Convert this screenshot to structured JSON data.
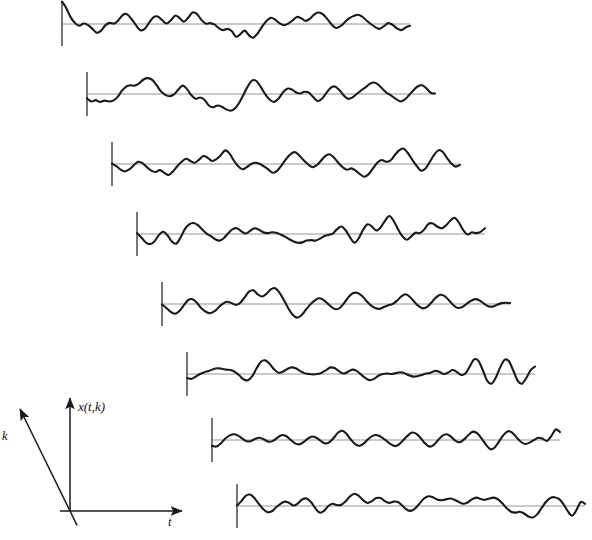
{
  "figure": {
    "kind": "ensemble-of-random-process-realizations",
    "background_color": "#ffffff",
    "width": 592,
    "height": 540,
    "trace_color": "#1a1a1a",
    "baseline_color": "#8a8a8a",
    "tick_color": "#4a4a4a",
    "axis_color": "#1a1a1a",
    "trace_stroke_width": 2.1,
    "baseline_stroke_width": 0.9,
    "tick_stroke_width": 1.5
  },
  "axes": {
    "vertical_label": "x(t,k)",
    "horizontal_label": "t",
    "depth_label": "k",
    "origin": {
      "x": 70,
      "y": 511
    },
    "vertical_tip": {
      "x": 70,
      "y": 398
    },
    "horizontal_tip": {
      "x": 182,
      "y": 511
    },
    "depth_tip": {
      "x": 20,
      "y": 409
    },
    "vertical_label_pos": {
      "x": 78,
      "y": 411
    },
    "horizontal_label_pos": {
      "x": 168,
      "y": 526
    },
    "depth_label_pos": {
      "x": 2,
      "y": 440
    }
  },
  "chart_data": {
    "type": "line",
    "title": "",
    "xlabel": "t",
    "ylabel": "x(t,k)",
    "zlabel": "k",
    "grid": false,
    "legend": "none",
    "series_count": 8,
    "samples_per_series": 81,
    "x_range": [
      0,
      80
    ],
    "y_range": [
      -1,
      1
    ],
    "geometry": {
      "first_baseline_x": 62,
      "first_baseline_y": 24,
      "stagger_dx": 25,
      "stagger_dy": 70,
      "trace_length": 348,
      "amplitude_px": 22,
      "tick_up": 22,
      "tick_down": 22
    },
    "series": [
      {
        "name": "k = 1",
        "baseline_origin": {
          "x": 62,
          "y": 24
        },
        "length": 348,
        "values": [
          1.02,
          0.72,
          0.3,
          0.05,
          -0.08,
          0.02,
          -0.05,
          -0.22,
          -0.4,
          -0.3,
          -0.05,
          0.05,
          0.02,
          0.18,
          0.42,
          0.44,
          0.22,
          -0.05,
          -0.28,
          -0.22,
          0.05,
          0.3,
          0.34,
          0.18,
          0.02,
          0.16,
          0.38,
          0.28,
          0.1,
          0.28,
          0.52,
          0.46,
          0.2,
          0.02,
          0.04,
          -0.02,
          -0.18,
          -0.28,
          -0.22,
          -0.32,
          -0.58,
          -0.46,
          -0.3,
          -0.52,
          -0.62,
          -0.42,
          -0.12,
          0.14,
          0.28,
          0.2,
          0.04,
          -0.06,
          0.02,
          0.16,
          0.32,
          0.26,
          0.14,
          0.24,
          0.44,
          0.52,
          0.44,
          0.22,
          -0.02,
          -0.18,
          -0.1,
          0.08,
          0.26,
          0.36,
          0.42,
          0.34,
          0.16,
          0.0,
          -0.14,
          -0.22,
          -0.1,
          0.04,
          -0.04,
          -0.2,
          -0.28,
          -0.16,
          -0.08
        ]
      },
      {
        "name": "k = 2",
        "baseline_origin": {
          "x": 87,
          "y": 94
        },
        "length": 348,
        "values": [
          -0.2,
          -0.34,
          -0.28,
          -0.36,
          -0.3,
          -0.34,
          -0.3,
          -0.14,
          0.14,
          0.34,
          0.4,
          0.38,
          0.48,
          0.66,
          0.72,
          0.64,
          0.4,
          0.12,
          -0.04,
          -0.1,
          -0.02,
          0.2,
          0.38,
          0.22,
          -0.06,
          -0.22,
          -0.16,
          -0.26,
          -0.52,
          -0.6,
          -0.52,
          -0.58,
          -0.7,
          -0.76,
          -0.66,
          -0.4,
          -0.02,
          0.36,
          0.62,
          0.58,
          0.3,
          -0.02,
          -0.26,
          -0.36,
          -0.22,
          0.06,
          0.24,
          0.22,
          0.08,
          0.02,
          0.1,
          0.06,
          -0.14,
          -0.32,
          -0.22,
          0.04,
          0.28,
          0.34,
          0.18,
          -0.06,
          -0.22,
          -0.16,
          0.0,
          0.16,
          0.3,
          0.46,
          0.52,
          0.42,
          0.22,
          0.04,
          -0.08,
          -0.22,
          -0.34,
          -0.26,
          -0.06,
          0.16,
          0.34,
          0.4,
          0.26,
          0.06,
          0.02
        ]
      },
      {
        "name": "k = 3",
        "baseline_origin": {
          "x": 112,
          "y": 164
        },
        "length": 348,
        "values": [
          0.02,
          -0.1,
          -0.26,
          -0.34,
          -0.24,
          -0.06,
          0.1,
          0.04,
          -0.14,
          -0.3,
          -0.36,
          -0.28,
          -0.4,
          -0.5,
          -0.34,
          -0.1,
          0.1,
          0.24,
          0.14,
          0.06,
          0.2,
          0.36,
          0.28,
          0.14,
          0.22,
          0.4,
          0.62,
          0.48,
          0.16,
          -0.1,
          -0.24,
          -0.14,
          0.0,
          0.06,
          0.0,
          -0.12,
          -0.26,
          -0.4,
          -0.3,
          -0.06,
          0.22,
          0.44,
          0.54,
          0.4,
          0.18,
          0.0,
          -0.14,
          -0.06,
          0.14,
          0.36,
          0.44,
          0.3,
          0.06,
          -0.14,
          -0.26,
          -0.2,
          -0.3,
          -0.46,
          -0.58,
          -0.46,
          -0.2,
          0.06,
          0.18,
          0.1,
          0.16,
          0.4,
          0.62,
          0.7,
          0.5,
          0.2,
          -0.08,
          -0.3,
          -0.22,
          0.08,
          0.4,
          0.62,
          0.56,
          0.28,
          0.02,
          -0.12,
          -0.04
        ]
      },
      {
        "name": "k = 4",
        "baseline_origin": {
          "x": 137,
          "y": 234
        },
        "length": 348,
        "values": [
          0.04,
          -0.16,
          -0.38,
          -0.46,
          -0.34,
          -0.06,
          0.1,
          -0.06,
          -0.34,
          -0.44,
          -0.16,
          0.22,
          0.44,
          0.5,
          0.4,
          0.2,
          0.02,
          -0.1,
          -0.24,
          -0.3,
          -0.18,
          0.04,
          0.22,
          0.26,
          0.12,
          0.02,
          0.14,
          0.26,
          0.2,
          0.08,
          0.04,
          0.08,
          0.06,
          -0.02,
          -0.12,
          -0.24,
          -0.34,
          -0.4,
          -0.38,
          -0.3,
          -0.28,
          -0.3,
          -0.22,
          -0.1,
          -0.04,
          0.02,
          0.22,
          0.34,
          0.16,
          -0.16,
          -0.4,
          -0.18,
          0.2,
          0.44,
          0.34,
          0.16,
          0.3,
          0.6,
          0.82,
          0.6,
          0.22,
          -0.1,
          -0.26,
          -0.12,
          0.06,
          0.04,
          0.2,
          0.46,
          0.48,
          0.34,
          0.26,
          0.38,
          0.6,
          0.74,
          0.52,
          0.18,
          -0.02,
          0.08,
          0.04,
          0.1,
          0.26
        ]
      },
      {
        "name": "k = 5",
        "baseline_origin": {
          "x": 162,
          "y": 304
        },
        "length": 348,
        "values": [
          -0.02,
          -0.18,
          -0.36,
          -0.44,
          -0.32,
          -0.06,
          0.18,
          0.22,
          0.06,
          -0.18,
          -0.34,
          -0.42,
          -0.34,
          -0.16,
          0.02,
          0.1,
          0.04,
          -0.04,
          0.06,
          0.3,
          0.56,
          0.62,
          0.44,
          0.34,
          0.46,
          0.66,
          0.72,
          0.52,
          0.18,
          -0.18,
          -0.48,
          -0.62,
          -0.52,
          -0.28,
          -0.04,
          0.14,
          0.26,
          0.2,
          0.04,
          -0.14,
          -0.24,
          -0.16,
          0.08,
          0.34,
          0.5,
          0.5,
          0.36,
          0.14,
          -0.06,
          -0.18,
          -0.22,
          -0.14,
          -0.06,
          0.0,
          0.14,
          0.34,
          0.44,
          0.32,
          0.1,
          -0.1,
          -0.2,
          -0.12,
          0.08,
          0.3,
          0.42,
          0.36,
          0.16,
          -0.06,
          -0.18,
          -0.14,
          0.0,
          0.14,
          0.22,
          0.16,
          0.02,
          -0.1,
          -0.12,
          -0.04,
          0.04,
          0.06,
          0.04
        ]
      },
      {
        "name": "k = 6",
        "baseline_origin": {
          "x": 187,
          "y": 374
        },
        "length": 348,
        "values": [
          -0.18,
          -0.22,
          -0.12,
          0.0,
          0.08,
          0.14,
          0.22,
          0.26,
          0.24,
          0.2,
          0.18,
          0.1,
          -0.06,
          -0.24,
          -0.28,
          -0.1,
          0.26,
          0.56,
          0.62,
          0.46,
          0.22,
          0.06,
          0.1,
          0.22,
          0.3,
          0.26,
          0.14,
          0.04,
          0.0,
          -0.02,
          0.0,
          0.06,
          0.18,
          0.3,
          0.26,
          0.12,
          0.02,
          0.1,
          0.2,
          0.14,
          -0.02,
          -0.18,
          -0.28,
          -0.22,
          -0.08,
          0.0,
          0.02,
          0.0,
          0.04,
          0.08,
          0.04,
          -0.06,
          -0.12,
          -0.1,
          -0.04,
          0.02,
          0.06,
          0.14,
          0.1,
          0.0,
          0.06,
          0.18,
          0.1,
          -0.04,
          0.02,
          0.34,
          0.66,
          0.6,
          0.18,
          -0.3,
          -0.44,
          -0.16,
          0.3,
          0.64,
          0.58,
          0.16,
          -0.3,
          -0.44,
          -0.18,
          0.18,
          0.34
        ]
      },
      {
        "name": "k = 7",
        "baseline_origin": {
          "x": 212,
          "y": 440
        },
        "length": 348,
        "values": [
          -0.26,
          -0.3,
          -0.16,
          0.06,
          0.2,
          0.26,
          0.2,
          0.06,
          -0.06,
          -0.04,
          0.06,
          0.1,
          0.02,
          -0.08,
          -0.04,
          0.1,
          0.22,
          0.18,
          0.02,
          -0.14,
          -0.2,
          -0.1,
          0.06,
          0.16,
          0.1,
          -0.04,
          -0.16,
          -0.1,
          0.1,
          0.34,
          0.42,
          0.26,
          0.0,
          -0.2,
          -0.26,
          -0.14,
          0.06,
          0.2,
          0.22,
          0.12,
          -0.02,
          -0.18,
          -0.28,
          -0.2,
          0.0,
          0.2,
          0.34,
          0.28,
          0.08,
          -0.16,
          -0.3,
          -0.22,
          0.0,
          0.2,
          0.26,
          0.14,
          -0.04,
          -0.1,
          0.04,
          0.24,
          0.38,
          0.3,
          0.06,
          -0.22,
          -0.42,
          -0.34,
          -0.06,
          0.22,
          0.4,
          0.34,
          0.12,
          -0.08,
          -0.18,
          -0.12,
          0.0,
          0.1,
          0.06,
          -0.04,
          0.18,
          0.48,
          0.36
        ]
      },
      {
        "name": "k = 8",
        "baseline_origin": {
          "x": 237,
          "y": 506
        },
        "length": 348,
        "values": [
          0.02,
          0.22,
          0.46,
          0.52,
          0.36,
          0.1,
          -0.14,
          -0.28,
          -0.24,
          -0.06,
          0.1,
          0.2,
          0.14,
          0.02,
          0.12,
          0.3,
          0.34,
          0.18,
          -0.1,
          -0.3,
          -0.22,
          0.0,
          0.1,
          0.04,
          0.06,
          0.22,
          0.44,
          0.56,
          0.46,
          0.26,
          0.14,
          0.22,
          0.36,
          0.36,
          0.22,
          0.14,
          0.2,
          0.18,
          0.02,
          -0.16,
          -0.22,
          -0.1,
          0.12,
          0.34,
          0.44,
          0.4,
          0.3,
          0.26,
          0.3,
          0.34,
          0.28,
          0.18,
          0.1,
          0.16,
          0.3,
          0.38,
          0.32,
          0.28,
          0.34,
          0.38,
          0.3,
          0.12,
          -0.1,
          -0.26,
          -0.3,
          -0.26,
          -0.34,
          -0.48,
          -0.52,
          -0.38,
          -0.1,
          0.18,
          0.36,
          0.4,
          0.32,
          0.1,
          -0.22,
          -0.44,
          -0.2,
          0.18,
          0.1
        ]
      }
    ]
  }
}
